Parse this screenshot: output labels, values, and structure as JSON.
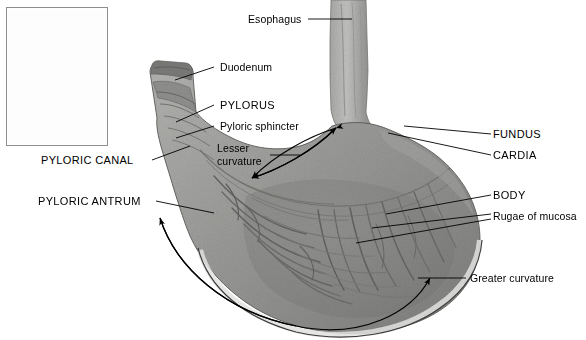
{
  "figure": {
    "kind": "anatomy-photograph-diagram",
    "background_color": "#ffffff",
    "label_color": "#000000",
    "leader_line_color": "#000000",
    "tissue_tone": "#9a9a99",
    "inset": {
      "name": "whole-stomach-orientation-inset",
      "description": "small pale grey whole stomach illustration",
      "border_color": "#8d8d8d"
    }
  },
  "labels": {
    "esophagus": "Esophagus",
    "duodenum": "Duodenum",
    "pylorus": "PYLORUS",
    "pyloric_sphincter": "Pyloric sphincter",
    "pyloric_canal": "PYLORIC CANAL",
    "pyloric_antrum": "PYLORIC ANTRUM",
    "lesser_curvature_line1": "Lesser",
    "lesser_curvature_line2": "curvature",
    "fundus": "FUNDUS",
    "cardia": "CARDIA",
    "body": "BODY",
    "rugae": "Rugae of mucosa",
    "greater_curvature": "Greater curvature"
  }
}
